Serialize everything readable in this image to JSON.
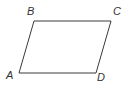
{
  "figure": {
    "type": "parallelogram",
    "shape_name": "parallelogram-abcd",
    "background_color": "#ffffff",
    "stroke_color": "#3a3a3a",
    "stroke_width": 1,
    "label_color": "#333333",
    "canvas": {
      "width": 130,
      "height": 92
    },
    "vertices": [
      {
        "id": "A",
        "label": "A",
        "x": 19,
        "y": 73,
        "label_x": 6,
        "label_y": 6
      },
      {
        "id": "B",
        "label": "B",
        "x": 34,
        "y": 21,
        "label_x": 27,
        "label_y": 6
      },
      {
        "id": "C",
        "label": "C",
        "x": 111,
        "y": 21,
        "label_x": 113,
        "label_y": 6
      },
      {
        "id": "D",
        "label": "D",
        "x": 96,
        "y": 73,
        "label_x": 97,
        "label_y": 72
      }
    ],
    "edges": [
      {
        "from": "A",
        "to": "B"
      },
      {
        "from": "B",
        "to": "C"
      },
      {
        "from": "C",
        "to": "D"
      },
      {
        "from": "D",
        "to": "A"
      }
    ],
    "outline_points": "19,73 34,21 111,21 96,73"
  }
}
